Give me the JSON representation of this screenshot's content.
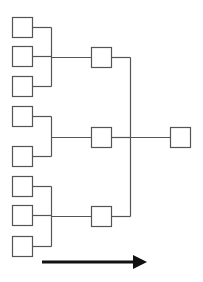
{
  "diagram": {
    "type": "tree-bracket",
    "width": 203,
    "height": 282,
    "colors": {
      "background": "#ffffff",
      "stroke": "#555555",
      "arrow": "#111111"
    },
    "box_size": 20,
    "levels": [
      {
        "name": "inputs",
        "x": 12,
        "boxes": [
          {
            "id": "in1",
            "y": 17
          },
          {
            "id": "in2",
            "y": 46
          },
          {
            "id": "in3",
            "y": 76
          },
          {
            "id": "in4",
            "y": 106
          },
          {
            "id": "in5",
            "y": 146
          },
          {
            "id": "in6",
            "y": 176
          },
          {
            "id": "in7",
            "y": 205
          },
          {
            "id": "in8",
            "y": 236
          }
        ]
      },
      {
        "name": "intermediate",
        "x": 91,
        "boxes": [
          {
            "id": "mid1",
            "y": 47
          },
          {
            "id": "mid2",
            "y": 127
          },
          {
            "id": "mid3",
            "y": 206
          }
        ]
      },
      {
        "name": "output",
        "x": 170,
        "boxes": [
          {
            "id": "out1",
            "y": 127
          }
        ]
      }
    ],
    "groups": [
      {
        "children": [
          "in1",
          "in2",
          "in3"
        ],
        "parent": "mid1",
        "bracket_x": 51
      },
      {
        "children": [
          "in4",
          "in5"
        ],
        "parent": "mid2",
        "bracket_x": 51
      },
      {
        "children": [
          "in6",
          "in7",
          "in8"
        ],
        "parent": "mid3",
        "bracket_x": 51
      },
      {
        "children": [
          "mid1",
          "mid2",
          "mid3"
        ],
        "parent": "out1",
        "bracket_x": 130
      }
    ],
    "arrow": {
      "x1": 42,
      "x2": 147,
      "y": 262,
      "direction": "right"
    }
  }
}
